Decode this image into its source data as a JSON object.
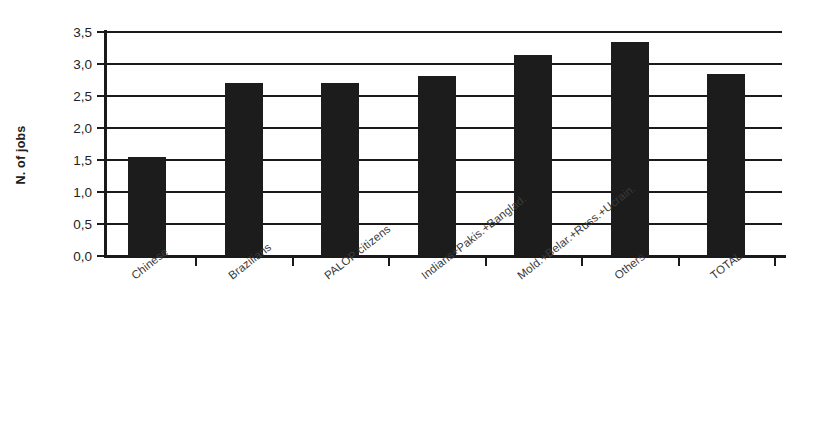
{
  "chart_data": {
    "type": "bar",
    "title": "",
    "xlabel": "",
    "ylabel": "N. of jobs",
    "ylim": [
      0.0,
      3.5
    ],
    "grid": true,
    "legend": false,
    "bar_color": "#1c1c1c",
    "categories": [
      "Chinese",
      "Brazilians",
      "PALOP citizens",
      "Indians+Pakis.+Banglad.",
      "Mold.+Belar.+Russ.+Ucrain.",
      "Others",
      "TOTAL"
    ],
    "values": [
      1.55,
      2.7,
      2.71,
      2.81,
      3.14,
      3.34,
      2.84
    ],
    "ytick_labels": [
      "0,0",
      "0,5",
      "1,0",
      "1,5",
      "2,0",
      "2,5",
      "3,0",
      "3,5"
    ],
    "ytick_values": [
      0.0,
      0.5,
      1.0,
      1.5,
      2.0,
      2.5,
      3.0,
      3.5
    ]
  }
}
